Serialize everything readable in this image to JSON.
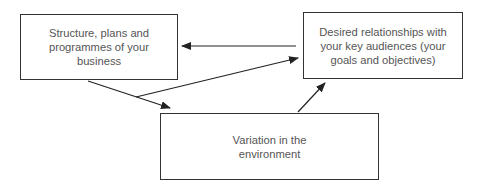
{
  "diagram": {
    "nodes": [
      {
        "id": "structure",
        "label": "Structure, plans and programmes of your business"
      },
      {
        "id": "relationships",
        "label": "Desired relationships with your key audiences (your goals and objectives)"
      },
      {
        "id": "variation",
        "label": "Variation in the environment"
      }
    ],
    "edges": [
      {
        "from": "relationships",
        "to": "structure"
      },
      {
        "from": "structure",
        "to": "variation"
      },
      {
        "from": "structure",
        "to": "relationships",
        "branch_of": "structure-to-variation"
      },
      {
        "from": "variation",
        "to": "relationships"
      }
    ],
    "colors": {
      "line": "#222222",
      "border": "#333333",
      "text": "#555555"
    }
  }
}
